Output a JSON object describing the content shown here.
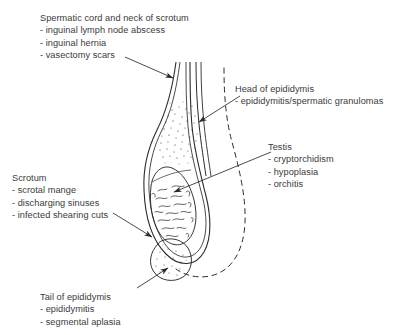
{
  "figure": {
    "type": "anatomical-diagram",
    "background_color": "#ffffff",
    "ink_color": "#2b2b2b",
    "text_color": "#3a3a3a"
  },
  "annotations": [
    {
      "id": "spermatic-cord",
      "header": "Spermatic cord and neck of scrotum",
      "items": [
        "- inguinal lymph node abscess",
        "- inguinal hernia",
        "- vasectomy scars"
      ]
    },
    {
      "id": "head-of-epididymis",
      "header": "Head of epididymis",
      "items": [
        "- epididymitis/spermatic granulomas"
      ]
    },
    {
      "id": "testis",
      "header": "Testis",
      "items": [
        "- cryptorchidism",
        "- hypoplasia",
        "- orchitis"
      ]
    },
    {
      "id": "scrotum",
      "header": "Scrotum",
      "items": [
        "- scrotal mange",
        "- discharging sinuses",
        "- infected shearing cuts"
      ]
    },
    {
      "id": "tail-of-epididymis",
      "header": "Tail of epididymis",
      "items": [
        "- epididymitis",
        "- segmental aplasia"
      ]
    }
  ],
  "structures": [
    {
      "id": "scrotal-wall",
      "label": "scrotal wall outline (double line)"
    },
    {
      "id": "spermatic-cord-body",
      "label": "spermatic cord with stipple texture"
    },
    {
      "id": "testis-body",
      "label": "testis with squiggle parenchyma texture"
    },
    {
      "id": "epididymis-tail-bulb",
      "label": "tail of epididymis bulb with stipple"
    },
    {
      "id": "opposite-sac-outline",
      "label": "opposite scrotal sac dashed outline"
    }
  ]
}
